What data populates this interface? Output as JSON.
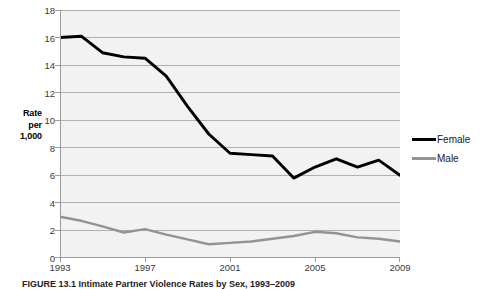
{
  "figure": {
    "caption": "FIGURE 13.1 Intimate Partner Violence Rates by Sex, 1993–2009"
  },
  "axes": {
    "y_title_line1": "Rate",
    "y_title_line2": "per",
    "y_title_line3": "1,000",
    "y_ticks": [
      "0",
      "2",
      "4",
      "6",
      "8",
      "10",
      "12",
      "14",
      "16",
      "18"
    ],
    "x_ticks": [
      "1993",
      "1997",
      "2001",
      "2005",
      "2009"
    ]
  },
  "legend": {
    "items": [
      {
        "label": "Female",
        "color": "#000000"
      },
      {
        "label": "Male",
        "color": "#939393"
      }
    ]
  },
  "colors": {
    "female_line": "#000000",
    "male_line": "#939393",
    "plot_background": "#f2f2f2",
    "gridline": "#b0b0b0",
    "axis": "#9a9a9a",
    "tick_text": "#3a3a3a"
  },
  "chart_data": {
    "type": "line",
    "title": "Intimate Partner Violence Rates by Sex, 1993–2009",
    "xlabel": "",
    "ylabel": "Rate per 1,000",
    "xlim": [
      1993,
      2009
    ],
    "ylim": [
      0,
      18
    ],
    "ytick_step": 2,
    "xtick_step": 4,
    "grid": "horizontal",
    "legend_position": "right",
    "x": [
      1993,
      1994,
      1995,
      1996,
      1997,
      1998,
      1999,
      2000,
      2001,
      2002,
      2003,
      2004,
      2005,
      2006,
      2007,
      2008,
      2009
    ],
    "series": [
      {
        "name": "Female",
        "color": "#000000",
        "values": [
          16.0,
          16.1,
          14.9,
          14.6,
          14.5,
          13.2,
          11.0,
          9.0,
          7.6,
          7.5,
          7.4,
          5.8,
          6.6,
          7.2,
          6.6,
          7.1,
          6.0
        ]
      },
      {
        "name": "Male",
        "color": "#939393",
        "values": [
          3.0,
          2.7,
          2.3,
          1.85,
          2.1,
          1.7,
          1.35,
          1.0,
          1.1,
          1.2,
          1.4,
          1.6,
          1.9,
          1.8,
          1.5,
          1.4,
          1.2
        ]
      }
    ]
  }
}
